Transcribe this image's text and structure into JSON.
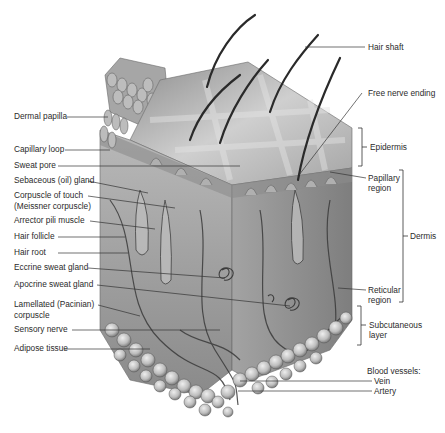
{
  "diagram": {
    "type": "anatomical-illustration",
    "colors": {
      "background": "#ffffff",
      "label_text": "#2b2b2b",
      "leader_line": "#333333",
      "tissue_light": "#c9c9c9",
      "tissue_mid": "#9a9a9a",
      "tissue_dark": "#5a5a5a"
    },
    "left_labels": [
      {
        "id": "dermal-papilla",
        "text": "Dermal papilla",
        "x": 14,
        "y": 113
      },
      {
        "id": "capillary-loop",
        "text": "Capillary loop",
        "x": 14,
        "y": 146
      },
      {
        "id": "sweat-pore",
        "text": "Sweat pore",
        "x": 14,
        "y": 162
      },
      {
        "id": "sebaceous-gland",
        "text": "Sebaceous (oil) gland",
        "x": 14,
        "y": 177
      },
      {
        "id": "corpuscle-of-touch",
        "text": "Corpuscle of touch",
        "x": 14,
        "y": 192
      },
      {
        "id": "corpuscle-of-touch-2",
        "text": "(Meissner corpuscle)",
        "x": 14,
        "y": 203
      },
      {
        "id": "arrector-pili",
        "text": "Arrector pili muscle",
        "x": 14,
        "y": 217
      },
      {
        "id": "hair-follicle",
        "text": "Hair follicle",
        "x": 14,
        "y": 233
      },
      {
        "id": "hair-root",
        "text": "Hair root",
        "x": 14,
        "y": 249
      },
      {
        "id": "eccrine-gland",
        "text": "Eccrine sweat gland",
        "x": 14,
        "y": 264
      },
      {
        "id": "apocrine-gland",
        "text": "Apocrine sweat gland",
        "x": 14,
        "y": 281
      },
      {
        "id": "lamellated-corpuscle",
        "text": "Lamellated (Pacinian)",
        "x": 14,
        "y": 301
      },
      {
        "id": "lamellated-corpuscle-2",
        "text": "corpuscle",
        "x": 14,
        "y": 312
      },
      {
        "id": "sensory-nerve",
        "text": "Sensory nerve",
        "x": 14,
        "y": 326
      },
      {
        "id": "adipose-tissue",
        "text": "Adipose tissue",
        "x": 14,
        "y": 345
      }
    ],
    "right_labels": [
      {
        "id": "hair-shaft",
        "text": "Hair shaft",
        "x": 368,
        "y": 42
      },
      {
        "id": "free-nerve-ending",
        "text": "Free nerve ending",
        "x": 368,
        "y": 89
      },
      {
        "id": "epidermis",
        "text": "Epidermis",
        "x": 370,
        "y": 143
      },
      {
        "id": "papillary-region",
        "text": "Papillary",
        "x": 368,
        "y": 174
      },
      {
        "id": "papillary-region-2",
        "text": "region",
        "x": 368,
        "y": 184
      },
      {
        "id": "dermis",
        "text": "Dermis",
        "x": 410,
        "y": 234
      },
      {
        "id": "reticular-region",
        "text": "Reticular",
        "x": 368,
        "y": 286
      },
      {
        "id": "reticular-region-2",
        "text": "region",
        "x": 368,
        "y": 296
      },
      {
        "id": "subcutaneous-layer",
        "text": "Subcutaneous",
        "x": 369,
        "y": 320
      },
      {
        "id": "subcutaneous-layer-2",
        "text": "layer",
        "x": 369,
        "y": 330
      },
      {
        "id": "blood-vessels",
        "text": "Blood vessels:",
        "x": 367,
        "y": 367
      },
      {
        "id": "vein",
        "text": "Vein",
        "x": 374,
        "y": 377
      },
      {
        "id": "artery",
        "text": "Artery",
        "x": 374,
        "y": 388
      }
    ],
    "brackets": [
      {
        "id": "epidermis-bracket",
        "label": "Epidermis",
        "x": 362,
        "y1": 128,
        "y2": 166
      },
      {
        "id": "dermis-bracket",
        "label": "Dermis",
        "x": 403,
        "y1": 170,
        "y2": 302
      },
      {
        "id": "subcutaneous-bracket",
        "label": "Subcutaneous layer",
        "x": 361,
        "y1": 306,
        "y2": 345
      }
    ]
  }
}
